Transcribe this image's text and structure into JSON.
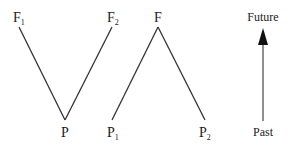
{
  "diagram": {
    "line_color": "#333333",
    "arrow_color": "#111111",
    "left_v": {
      "top_left_label": "F",
      "top_left_sub": "1",
      "top_right_label": "F",
      "top_right_sub": "2",
      "bottom_label": "P",
      "bottom_sub": ""
    },
    "right_lambda": {
      "top_label": "F",
      "top_sub": "",
      "bottom_left_label": "P",
      "bottom_left_sub": "1",
      "bottom_right_label": "P",
      "bottom_right_sub": "2"
    },
    "time_arrow": {
      "top_label": "Future",
      "bottom_label": "Past"
    }
  }
}
